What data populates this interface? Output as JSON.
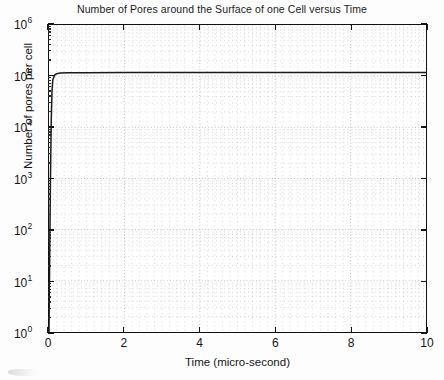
{
  "figure": {
    "title": "Number of Pores around the Surface of one Cell versus Time",
    "xlabel": "Time  (micro-second)",
    "ylabel": "Number of pores per cell"
  },
  "axes": {
    "x_tick_labels": [
      "0",
      "2",
      "4",
      "6",
      "8",
      "10"
    ],
    "y_tick_mantissa": "10",
    "y_tick_exponents": [
      "6",
      "5",
      "4",
      "3",
      "2",
      "1",
      "0"
    ]
  },
  "style": {
    "line_color": "#1a1a1a",
    "grid_color": "#b9b9b9",
    "axis_color": "#111111",
    "background": "#ffffff"
  },
  "chart_data": {
    "type": "line",
    "title": "Number of Pores around the Surface of one Cell versus Time",
    "xlabel": "Time  (micro-second)",
    "ylabel": "Number of pores per cell",
    "xlim": [
      0,
      10
    ],
    "ylim": [
      1,
      1000000
    ],
    "yscale": "log",
    "xscale": "linear",
    "grid": true,
    "grid_style": "dotted",
    "grid_minor": true,
    "legend": null,
    "xticks": [
      0,
      2,
      4,
      6,
      8,
      10
    ],
    "yticks": [
      1,
      10,
      100,
      1000,
      10000,
      100000,
      1000000
    ],
    "series": [
      {
        "name": "Number of pores per cell",
        "x": [
          0,
          0.02,
          0.04,
          0.06,
          0.08,
          0.1,
          0.15,
          0.2,
          0.3,
          0.5,
          1,
          2,
          3,
          4,
          5,
          6,
          7,
          8,
          9,
          10
        ],
        "y": [
          1,
          40,
          1200,
          14000,
          52000,
          84000,
          105000,
          112000,
          115000,
          116000,
          117000,
          118000,
          118000,
          118000,
          118000,
          118000,
          118000,
          118000,
          118000,
          118000
        ]
      }
    ],
    "annotations": [
      "Curve rises almost vertically at t = 0 from 10^0 to just above 10^5, then remains flat through t = 10."
    ]
  }
}
